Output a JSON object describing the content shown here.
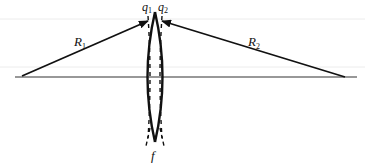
{
  "diagram": {
    "labels": {
      "q1": "q",
      "q1_sub": "1",
      "q2": "q",
      "q2_sub": "2",
      "r1": "R",
      "r1_sub": "1",
      "r2": "R",
      "r2_sub": "2",
      "focus": "f"
    },
    "colors": {
      "line": "#111111",
      "guide": "#e6e6e6",
      "background": "#ffffff"
    }
  }
}
